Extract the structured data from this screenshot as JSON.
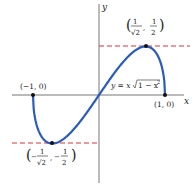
{
  "diagram": {
    "equation": "y = x√(1 − x²)",
    "axes": {
      "x_label": "x",
      "y_label": "y"
    },
    "points": [
      {
        "label": "(−1, 0)",
        "x": -1,
        "y": 0
      },
      {
        "label": "(1, 0)",
        "x": 1,
        "y": 0
      },
      {
        "label_num_x": "1",
        "label_den_x": "√2",
        "label_num_y": "1",
        "label_den_y": "2",
        "x": 0.7071,
        "y": 0.5,
        "type": "maximum"
      },
      {
        "label_num_x": "1",
        "label_den_x": "√2",
        "label_num_y": "1",
        "label_den_y": "2",
        "sign": "−",
        "x": -0.7071,
        "y": -0.5,
        "type": "minimum"
      }
    ],
    "eq_parts": {
      "lhs": "y = x",
      "rad": "1 − x",
      "sup": "2"
    },
    "colors": {
      "curve": "#2a5bbf",
      "dash": "#d9343a",
      "axis": "#555555",
      "point": "#111111"
    }
  }
}
